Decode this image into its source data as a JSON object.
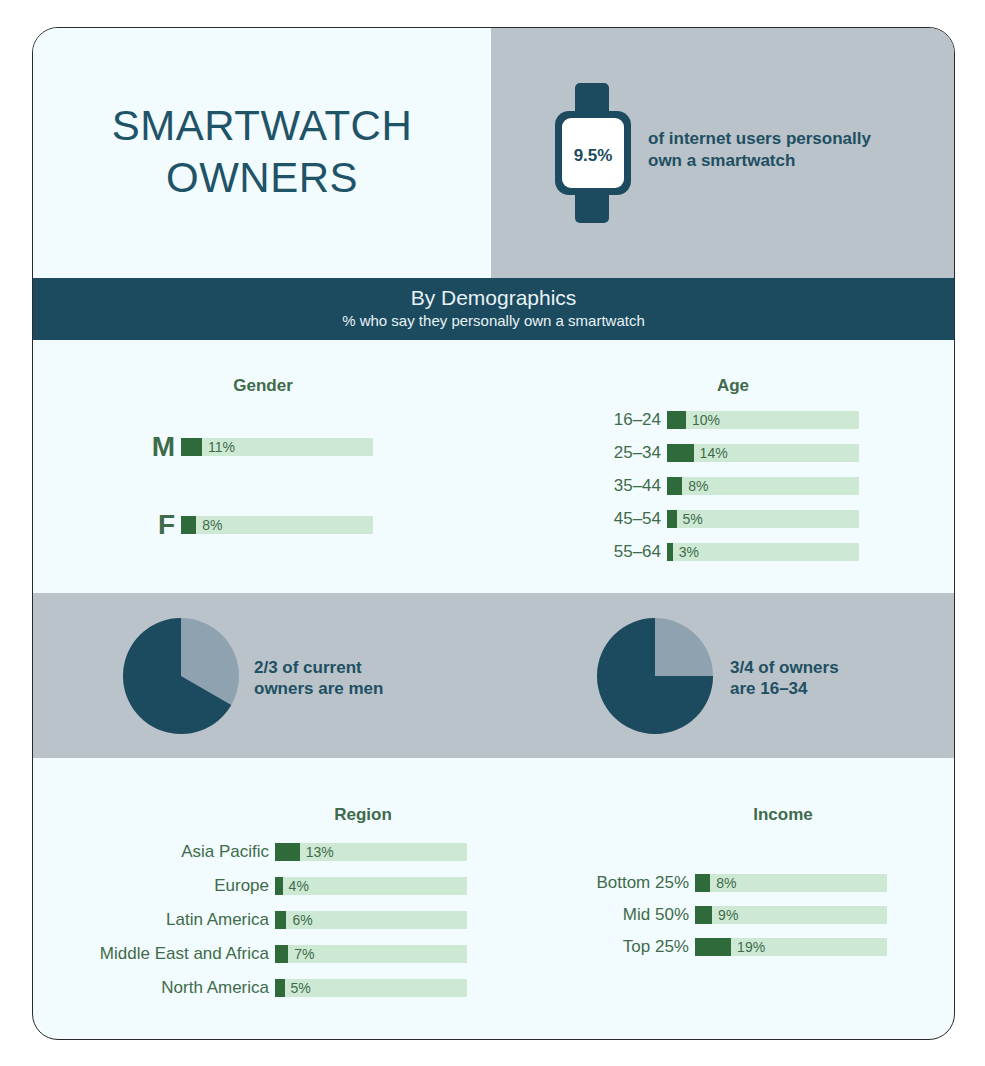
{
  "header": {
    "title_line1": "SMARTWATCH",
    "title_line2": "OWNERS",
    "stat_value": "9.5%",
    "stat_text_line1": "of internet users personally",
    "stat_text_line2": "own a smartwatch"
  },
  "banner": {
    "title": "By Demographics",
    "subtitle": "% who say they personally own a smartwatch"
  },
  "gender": {
    "title": "Gender",
    "rows": [
      {
        "label": "M",
        "value": 11,
        "text": "11%"
      },
      {
        "label": "F",
        "value": 8,
        "text": "8%"
      }
    ]
  },
  "age": {
    "title": "Age",
    "rows": [
      {
        "label": "16–24",
        "value": 10,
        "text": "10%"
      },
      {
        "label": "25–34",
        "value": 14,
        "text": "14%"
      },
      {
        "label": "35–44",
        "value": 8,
        "text": "8%"
      },
      {
        "label": "45–54",
        "value": 5,
        "text": "5%"
      },
      {
        "label": "55–64",
        "value": 3,
        "text": "3%"
      }
    ]
  },
  "pies": [
    {
      "text_line1": "2/3 of current",
      "text_line2": "owners are men",
      "fraction": 0.6667
    },
    {
      "text_line1": "3/4 of owners",
      "text_line2": "are 16–34",
      "fraction": 0.75
    }
  ],
  "region": {
    "title": "Region",
    "rows": [
      {
        "label": "Asia Pacific",
        "value": 13,
        "text": "13%"
      },
      {
        "label": "Europe",
        "value": 4,
        "text": "4%"
      },
      {
        "label": "Latin America",
        "value": 6,
        "text": "6%"
      },
      {
        "label": "Middle East and Africa",
        "value": 7,
        "text": "7%"
      },
      {
        "label": "North America",
        "value": 5,
        "text": "5%"
      }
    ]
  },
  "income": {
    "title": "Income",
    "rows": [
      {
        "label": "Bottom 25%",
        "value": 8,
        "text": "8%"
      },
      {
        "label": "Mid 50%",
        "value": 9,
        "text": "9%"
      },
      {
        "label": "Top 25%",
        "value": 19,
        "text": "19%"
      }
    ]
  },
  "colors": {
    "dark_teal": "#1c4a5e",
    "gray_band": "#b9c3c9",
    "bar_fill": "#2f6a3a",
    "bar_track": "#cde9d4",
    "label_green": "#3f6b4a",
    "background": "#f2fbfd"
  },
  "chart_data": [
    {
      "type": "bar",
      "title": "Gender",
      "categories": [
        "M",
        "F"
      ],
      "values": [
        11,
        8
      ],
      "unit": "%"
    },
    {
      "type": "bar",
      "title": "Age",
      "categories": [
        "16–24",
        "25–34",
        "35–44",
        "45–54",
        "55–64"
      ],
      "values": [
        10,
        14,
        8,
        5,
        3
      ],
      "unit": "%"
    },
    {
      "type": "pie",
      "title": "2/3 of current owners are men",
      "categories": [
        "Men",
        "Other"
      ],
      "values": [
        66.7,
        33.3
      ]
    },
    {
      "type": "pie",
      "title": "3/4 of owners are 16–34",
      "categories": [
        "16–34",
        "Other"
      ],
      "values": [
        75,
        25
      ]
    },
    {
      "type": "bar",
      "title": "Region",
      "categories": [
        "Asia Pacific",
        "Europe",
        "Latin America",
        "Middle East and Africa",
        "North America"
      ],
      "values": [
        13,
        4,
        6,
        7,
        5
      ],
      "unit": "%"
    },
    {
      "type": "bar",
      "title": "Income",
      "categories": [
        "Bottom 25%",
        "Mid 50%",
        "Top 25%"
      ],
      "values": [
        8,
        9,
        19
      ],
      "unit": "%"
    }
  ]
}
